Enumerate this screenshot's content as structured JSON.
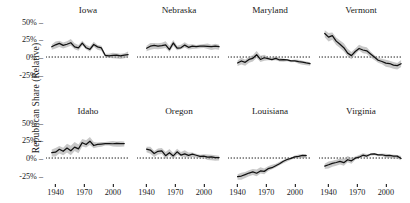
{
  "axes": {
    "ylabel": "Republican Share (Relative)",
    "yticks": [
      "50%",
      "25%",
      "0%",
      "-25%"
    ],
    "yvalues": [
      50,
      25,
      0,
      -25
    ],
    "ylim": [
      -37,
      57
    ],
    "xticks": [
      "1940",
      "1970",
      "2000"
    ],
    "xvalues": [
      1940,
      1970,
      2000
    ],
    "xlim": [
      1930,
      2018
    ],
    "tick_dash": "–"
  },
  "style": {
    "line_color": "#111111",
    "band_color": "#9a9a9a",
    "zero_line_color": "#000000",
    "background": "#ffffff"
  },
  "chart_data": {
    "type": "line",
    "title": "",
    "xlabel": "",
    "ylabel": "Republican Share (Relative)",
    "xlim": [
      1930,
      2018
    ],
    "ylim": [
      -37,
      57
    ],
    "grid": false,
    "legend": "none",
    "layout": "small-multiples 2x4",
    "zero_reference_line": 0,
    "band_meaning": "confidence interval",
    "panels": [
      {
        "name": "Iowa",
        "row": 0,
        "col": 0,
        "x": [
          1936,
          1940,
          1944,
          1948,
          1952,
          1956,
          1960,
          1964,
          1968,
          1972,
          1976,
          1980,
          1984,
          1988,
          1992,
          1996,
          2000,
          2004,
          2008,
          2012,
          2016
        ],
        "y": [
          14,
          17,
          19,
          16,
          18,
          21,
          15,
          13,
          20,
          14,
          11,
          18,
          14,
          12,
          2,
          1,
          2,
          2,
          1,
          2,
          4
        ],
        "lower": [
          10,
          13,
          15,
          12,
          14,
          17,
          11,
          9,
          16,
          10,
          7,
          14,
          10,
          8,
          -1,
          -2,
          -1,
          -1,
          -2,
          -1,
          1
        ],
        "upper": [
          18,
          21,
          23,
          20,
          22,
          25,
          19,
          17,
          24,
          18,
          15,
          22,
          18,
          16,
          5,
          4,
          5,
          5,
          4,
          5,
          7
        ]
      },
      {
        "name": "Nebraska",
        "row": 0,
        "col": 1,
        "x": [
          1940,
          1944,
          1948,
          1952,
          1956,
          1960,
          1964,
          1968,
          1972,
          1976,
          1980,
          1984,
          1988,
          1992,
          1996,
          2000,
          2004,
          2008,
          2012,
          2016
        ],
        "y": [
          12,
          15,
          16,
          15,
          16,
          18,
          11,
          20,
          13,
          14,
          17,
          14,
          15,
          14,
          15,
          15,
          15,
          14,
          15,
          14
        ],
        "lower": [
          8,
          11,
          12,
          11,
          12,
          14,
          7,
          16,
          9,
          10,
          13,
          10,
          11,
          11,
          12,
          12,
          12,
          11,
          12,
          11
        ],
        "upper": [
          16,
          19,
          20,
          19,
          20,
          22,
          15,
          24,
          17,
          18,
          21,
          18,
          19,
          17,
          18,
          18,
          18,
          17,
          18,
          17
        ]
      },
      {
        "name": "Maryland",
        "row": 0,
        "col": 2,
        "x": [
          1940,
          1944,
          1948,
          1952,
          1956,
          1960,
          1964,
          1968,
          1972,
          1976,
          1980,
          1984,
          1988,
          1992,
          1996,
          2000,
          2004,
          2008,
          2012,
          2016
        ],
        "y": [
          -9,
          -6,
          -8,
          -4,
          -2,
          4,
          -3,
          -1,
          -2,
          -3,
          -2,
          -4,
          -4,
          -5,
          -6,
          -6,
          -7,
          -8,
          -9,
          -10
        ],
        "lower": [
          -13,
          -10,
          -12,
          -8,
          -6,
          0,
          -7,
          -5,
          -5,
          -6,
          -5,
          -7,
          -7,
          -7,
          -8,
          -8,
          -9,
          -10,
          -11,
          -12
        ],
        "upper": [
          -5,
          -2,
          -4,
          0,
          2,
          8,
          1,
          3,
          1,
          0,
          1,
          -1,
          -1,
          -3,
          -4,
          -4,
          -5,
          -6,
          -7,
          -8
        ]
      },
      {
        "name": "Vermont",
        "row": 0,
        "col": 3,
        "x": [
          1936,
          1940,
          1944,
          1948,
          1952,
          1956,
          1960,
          1964,
          1968,
          1972,
          1976,
          1980,
          1984,
          1988,
          1992,
          1996,
          2000,
          2004,
          2008,
          2012,
          2016
        ],
        "y": [
          33,
          28,
          30,
          22,
          18,
          14,
          6,
          2,
          8,
          13,
          10,
          9,
          4,
          -1,
          -5,
          -7,
          -9,
          -10,
          -12,
          -13,
          -9
        ],
        "lower": [
          28,
          23,
          25,
          17,
          13,
          9,
          1,
          -3,
          3,
          8,
          5,
          4,
          -1,
          -5,
          -9,
          -11,
          -13,
          -14,
          -16,
          -17,
          -13
        ],
        "upper": [
          38,
          33,
          35,
          27,
          23,
          19,
          11,
          7,
          13,
          18,
          15,
          14,
          9,
          3,
          -1,
          -3,
          -5,
          -6,
          -8,
          -9,
          -5
        ]
      },
      {
        "name": "Idaho",
        "row": 1,
        "col": 0,
        "x": [
          1936,
          1940,
          1944,
          1948,
          1952,
          1956,
          1960,
          1964,
          1968,
          1972,
          1976,
          1980,
          1984,
          1988,
          1992,
          1996,
          2000,
          2004,
          2008,
          2012
        ],
        "y": [
          7,
          8,
          12,
          9,
          14,
          11,
          16,
          13,
          22,
          20,
          24,
          18,
          19,
          19,
          20,
          20,
          20,
          20,
          20,
          20
        ],
        "lower": [
          2,
          3,
          7,
          4,
          8,
          5,
          10,
          7,
          16,
          14,
          18,
          13,
          15,
          15,
          17,
          17,
          17,
          17,
          17,
          17
        ],
        "upper": [
          12,
          13,
          17,
          14,
          20,
          17,
          22,
          19,
          28,
          26,
          30,
          23,
          23,
          23,
          23,
          23,
          23,
          23,
          23,
          23
        ]
      },
      {
        "name": "Oregon",
        "row": 1,
        "col": 1,
        "x": [
          1940,
          1944,
          1948,
          1952,
          1956,
          1960,
          1964,
          1968,
          1972,
          1976,
          1980,
          1984,
          1988,
          1992,
          1996,
          2000,
          2004,
          2008,
          2012,
          2016
        ],
        "y": [
          12,
          11,
          6,
          9,
          10,
          4,
          8,
          3,
          9,
          5,
          6,
          4,
          5,
          3,
          2,
          2,
          1,
          1,
          0,
          0
        ],
        "lower": [
          8,
          7,
          2,
          5,
          6,
          0,
          4,
          -1,
          4,
          1,
          1,
          0,
          1,
          0,
          -1,
          -1,
          -2,
          -2,
          -3,
          -3
        ],
        "upper": [
          16,
          15,
          10,
          13,
          14,
          8,
          12,
          7,
          14,
          9,
          11,
          8,
          9,
          6,
          5,
          5,
          4,
          4,
          3,
          3
        ]
      },
      {
        "name": "Louisiana",
        "row": 1,
        "col": 2,
        "x": [
          1940,
          1944,
          1948,
          1952,
          1956,
          1960,
          1964,
          1968,
          1972,
          1976,
          1980,
          1984,
          1988,
          1992,
          1996,
          2000,
          2004,
          2008,
          2012
        ],
        "y": [
          -27,
          -26,
          -24,
          -22,
          -20,
          -21,
          -18,
          -19,
          -15,
          -13,
          -11,
          -8,
          -5,
          -3,
          -1,
          1,
          2,
          3,
          3
        ],
        "lower": [
          -31,
          -30,
          -28,
          -26,
          -24,
          -25,
          -22,
          -23,
          -19,
          -17,
          -14,
          -11,
          -8,
          -6,
          -3,
          -1,
          0,
          1,
          1
        ],
        "upper": [
          -23,
          -22,
          -20,
          -18,
          -16,
          -17,
          -14,
          -15,
          -11,
          -9,
          -8,
          -5,
          -2,
          0,
          1,
          3,
          4,
          5,
          5
        ]
      },
      {
        "name": "Virginia",
        "row": 1,
        "col": 3,
        "x": [
          1936,
          1940,
          1944,
          1948,
          1952,
          1956,
          1960,
          1964,
          1968,
          1972,
          1976,
          1980,
          1984,
          1988,
          1992,
          1996,
          2000,
          2004,
          2008,
          2012,
          2016
        ],
        "y": [
          -12,
          -10,
          -8,
          -7,
          -5,
          -6,
          -2,
          -4,
          0,
          2,
          4,
          3,
          5,
          5,
          4,
          4,
          3,
          3,
          2,
          2,
          0
        ],
        "lower": [
          -16,
          -14,
          -12,
          -11,
          -9,
          -10,
          -6,
          -8,
          -3,
          -1,
          1,
          0,
          3,
          3,
          2,
          2,
          1,
          1,
          0,
          0,
          -2
        ],
        "upper": [
          -8,
          -6,
          -4,
          -3,
          -1,
          -2,
          2,
          0,
          3,
          5,
          7,
          6,
          7,
          7,
          6,
          6,
          5,
          5,
          4,
          4,
          2
        ]
      }
    ]
  }
}
